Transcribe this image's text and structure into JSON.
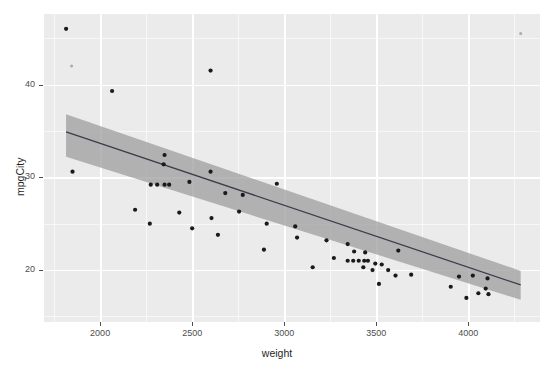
{
  "chart_data": {
    "type": "scatter",
    "title": "",
    "xlabel": "weight",
    "ylabel": "mpgCity",
    "xlim": [
      1695,
      4390
    ],
    "ylim": [
      14.4,
      47.6
    ],
    "x_ticks": [
      2000,
      2500,
      3000,
      3500,
      4000
    ],
    "y_ticks": [
      20,
      30,
      40
    ],
    "x_minor_ticks": [
      1750,
      2250,
      2750,
      3250,
      3750,
      4250
    ],
    "y_minor_ticks": [
      15,
      25,
      35,
      45
    ],
    "grid": true,
    "legend": "none",
    "panel_background": "#ebebeb",
    "grid_color": "#ffffff",
    "point_color": "#1a1a1a",
    "line_color": "#3c3c4a",
    "band_color": "#9a9a9a",
    "points": [
      {
        "x": 1815,
        "y": 46.0
      },
      {
        "x": 1845,
        "y": 42.0,
        "faint": true
      },
      {
        "x": 2600,
        "y": 41.5
      },
      {
        "x": 2065,
        "y": 39.3
      },
      {
        "x": 1850,
        "y": 30.6
      },
      {
        "x": 2350,
        "y": 32.4
      },
      {
        "x": 2345,
        "y": 31.4
      },
      {
        "x": 2600,
        "y": 30.6
      },
      {
        "x": 2485,
        "y": 29.5
      },
      {
        "x": 2275,
        "y": 29.2
      },
      {
        "x": 2310,
        "y": 29.2
      },
      {
        "x": 2350,
        "y": 29.2
      },
      {
        "x": 2375,
        "y": 29.2
      },
      {
        "x": 2960,
        "y": 29.3
      },
      {
        "x": 2680,
        "y": 28.3
      },
      {
        "x": 2775,
        "y": 28.1
      },
      {
        "x": 2190,
        "y": 26.5
      },
      {
        "x": 2430,
        "y": 26.2
      },
      {
        "x": 2755,
        "y": 26.3
      },
      {
        "x": 2605,
        "y": 25.6
      },
      {
        "x": 2270,
        "y": 25.0
      },
      {
        "x": 2905,
        "y": 25.0
      },
      {
        "x": 2500,
        "y": 24.5
      },
      {
        "x": 3060,
        "y": 24.7
      },
      {
        "x": 2640,
        "y": 23.8
      },
      {
        "x": 3070,
        "y": 23.5
      },
      {
        "x": 3230,
        "y": 23.2
      },
      {
        "x": 3345,
        "y": 22.8
      },
      {
        "x": 2890,
        "y": 22.2
      },
      {
        "x": 3380,
        "y": 22.0
      },
      {
        "x": 3440,
        "y": 21.9
      },
      {
        "x": 3270,
        "y": 21.3
      },
      {
        "x": 3345,
        "y": 21.0
      },
      {
        "x": 3375,
        "y": 21.0
      },
      {
        "x": 3405,
        "y": 21.0
      },
      {
        "x": 3435,
        "y": 21.0
      },
      {
        "x": 3455,
        "y": 21.0
      },
      {
        "x": 3495,
        "y": 20.7
      },
      {
        "x": 3530,
        "y": 20.6
      },
      {
        "x": 3620,
        "y": 22.1
      },
      {
        "x": 3155,
        "y": 20.3
      },
      {
        "x": 3430,
        "y": 20.3
      },
      {
        "x": 3480,
        "y": 20.0
      },
      {
        "x": 3565,
        "y": 20.0
      },
      {
        "x": 3605,
        "y": 19.4
      },
      {
        "x": 3690,
        "y": 19.5
      },
      {
        "x": 3515,
        "y": 18.5
      },
      {
        "x": 3950,
        "y": 19.3
      },
      {
        "x": 4025,
        "y": 19.4
      },
      {
        "x": 4105,
        "y": 19.1
      },
      {
        "x": 3905,
        "y": 18.2
      },
      {
        "x": 4095,
        "y": 18.0
      },
      {
        "x": 4055,
        "y": 17.5
      },
      {
        "x": 3990,
        "y": 17.0
      },
      {
        "x": 4110,
        "y": 17.4
      },
      {
        "x": 4285,
        "y": 45.5,
        "faint": true
      }
    ],
    "fit": {
      "method": "lm",
      "x_start": 1815,
      "x_end": 4285,
      "y_start": 34.9,
      "y_end": 18.4,
      "ci_start_upper": 36.8,
      "ci_start_lower": 32.2,
      "ci_end_upper": 19.9,
      "ci_end_lower": 16.8
    }
  },
  "axes": {
    "x_title": "weight",
    "y_title": "mpgCity",
    "x_tick_labels": [
      "2000",
      "2500",
      "3000",
      "3500",
      "4000"
    ],
    "y_tick_labels": [
      "20",
      "30",
      "40"
    ]
  }
}
